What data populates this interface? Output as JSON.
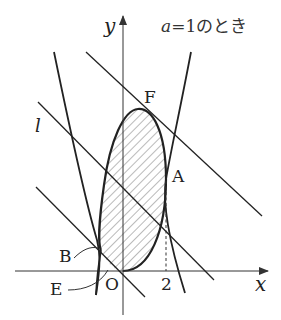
{
  "title": "a=1のとき",
  "title_parts": {
    "var": "a",
    "rest": "=1のとき"
  },
  "axes": {
    "x_label": "x",
    "y_label": "y",
    "origin_label": "O",
    "x_tick_label": "2"
  },
  "points": {
    "A": "A",
    "B": "B",
    "E": "E",
    "F": "F"
  },
  "line_label": "l",
  "colors": {
    "stroke": "#222222",
    "hatch": "#555555",
    "background": "#ffffff"
  }
}
